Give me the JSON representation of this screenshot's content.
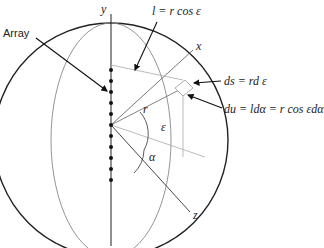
{
  "diagram": {
    "labels": {
      "array": "Array",
      "y_axis": "y",
      "x_axis": "x",
      "z_axis": "z",
      "r": "r",
      "epsilon": "ε",
      "alpha": "α",
      "l_eq": "l = r cos ε",
      "ds_eq": "ds = rd ε",
      "du_eq": "du = ldα = r cos εdα"
    },
    "array_elements": 11,
    "colors": {
      "stroke_dark": "#222222",
      "stroke_light": "#9a9a9a"
    }
  }
}
